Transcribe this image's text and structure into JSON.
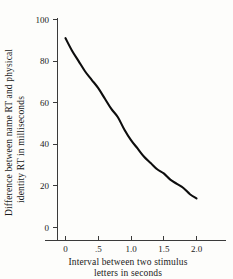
{
  "chart_data": {
    "type": "line",
    "title": "",
    "xlabel": "Interval between two stimulus letters in seconds",
    "ylabel": "Difference between name RT and physical identity RT in milliseconds",
    "xlabel_line1": "Interval between two stimulus",
    "xlabel_line2": "letters in seconds",
    "ylabel_line1": "Difference between name RT and physical",
    "ylabel_line2": "identity RT in milliseconds",
    "xlim": [
      0,
      2.0
    ],
    "ylim": [
      0,
      100
    ],
    "grid": false,
    "legend": false,
    "x_ticks": [
      "0",
      ".5",
      "1.0",
      "1.5",
      "2.0"
    ],
    "x_tick_values": [
      0,
      0.5,
      1.0,
      1.5,
      2.0
    ],
    "y_ticks": [
      "0",
      "20",
      "40",
      "60",
      "80",
      "100"
    ],
    "y_tick_values": [
      0,
      20,
      40,
      60,
      80,
      100
    ],
    "series": [
      {
        "name": "Name RT minus physical identity RT",
        "x": [
          0.0,
          0.1,
          0.2,
          0.3,
          0.4,
          0.5,
          0.6,
          0.7,
          0.8,
          0.9,
          1.0,
          1.1,
          1.2,
          1.3,
          1.4,
          1.5,
          1.6,
          1.7,
          1.8,
          1.9,
          2.0
        ],
        "values": [
          91,
          85,
          80,
          75,
          71,
          67,
          62,
          57,
          53,
          47,
          42,
          38,
          34,
          31,
          28,
          26,
          23,
          21,
          19,
          16,
          14
        ],
        "color": "#0d0d0d"
      }
    ]
  }
}
